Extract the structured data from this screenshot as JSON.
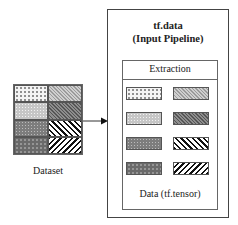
{
  "dataset": {
    "label": "Dataset",
    "cells": [
      {
        "pattern": "dots-light"
      },
      {
        "pattern": "diag-light"
      },
      {
        "pattern": "dots-mid"
      },
      {
        "pattern": "diag-dark"
      },
      {
        "pattern": "dots-dark"
      },
      {
        "pattern": "stripe-back"
      },
      {
        "pattern": "dots-darker"
      },
      {
        "pattern": "stripe-fwd"
      }
    ]
  },
  "arrow": {
    "from": "dataset",
    "to": "pipeline"
  },
  "pipeline": {
    "title_line1": "tf.data",
    "title_line2": "(Input Pipeline)",
    "stage_label": "Extraction",
    "output_label": "Data (tf.tensor)",
    "swatches": [
      {
        "pattern": "dots-light"
      },
      {
        "pattern": "diag-light"
      },
      {
        "pattern": "dots-mid"
      },
      {
        "pattern": "diag-dark"
      },
      {
        "pattern": "dots-dark"
      },
      {
        "pattern": "stripe-back"
      },
      {
        "pattern": "dots-darker"
      },
      {
        "pattern": "stripe-fwd"
      }
    ]
  },
  "colors": {
    "border": "#444444",
    "background": "#ffffff"
  }
}
